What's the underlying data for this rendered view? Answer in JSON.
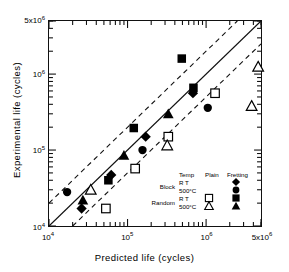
{
  "chart_data": {
    "type": "scatter",
    "title": "",
    "xlabel": "Predicted life  (cycles)",
    "ylabel": "Experimental  life  (cycles)",
    "xlim": [
      10000,
      5000000
    ],
    "ylim": [
      10000,
      5000000
    ],
    "xscale": "log",
    "yscale": "log",
    "grid": false,
    "legend_position": "inside-lower-right",
    "xticks": [
      {
        "value": 10000,
        "label": "10",
        "exp": "4"
      },
      {
        "value": 100000,
        "label": "10",
        "exp": "5"
      },
      {
        "value": 1000000,
        "label": "10",
        "exp": "6"
      },
      {
        "value": 5000000,
        "label": "5x10",
        "exp": "6"
      }
    ],
    "yticks": [
      {
        "value": 10000,
        "label": "10",
        "exp": "4"
      },
      {
        "value": 100000,
        "label": "10",
        "exp": "5"
      },
      {
        "value": 1000000,
        "label": "10",
        "exp": "6"
      },
      {
        "value": 5000000,
        "label": "5x10",
        "exp": "6"
      }
    ],
    "reference_lines": [
      {
        "name": "one-to-one",
        "style": "solid",
        "factor": 1
      },
      {
        "name": "upper-bound-factor-2",
        "style": "dashed",
        "factor": 2
      },
      {
        "name": "lower-bound-factor-2",
        "style": "dashed",
        "factor": 0.5
      }
    ],
    "series": [
      {
        "name": "Block R T Fretting",
        "marker": "filled-diamond",
        "condition": "Fretting",
        "loading": "Block",
        "temperature": "R T",
        "points": [
          {
            "x": 26000,
            "y": 17000
          },
          {
            "x": 62000,
            "y": 47000
          },
          {
            "x": 170000,
            "y": 150000
          },
          {
            "x": 680000,
            "y": 560000
          }
        ]
      },
      {
        "name": "Block 500°C Fretting",
        "marker": "filled-circle",
        "condition": "Fretting",
        "loading": "Block",
        "temperature": "500°C",
        "points": [
          {
            "x": 17000,
            "y": 28000
          },
          {
            "x": 155000,
            "y": 100000
          },
          {
            "x": 1050000,
            "y": 360000
          }
        ]
      },
      {
        "name": "Random R T Fretting",
        "marker": "filled-square",
        "condition": "Fretting",
        "loading": "Random",
        "temperature": "R T",
        "points": [
          {
            "x": 57000,
            "y": 40000
          },
          {
            "x": 120000,
            "y": 195000
          },
          {
            "x": 490000,
            "y": 1600000
          },
          {
            "x": 690000,
            "y": 660000
          }
        ]
      },
      {
        "name": "Random 500°C Fretting",
        "marker": "filled-triangle",
        "condition": "Fretting",
        "loading": "Random",
        "temperature": "500°C",
        "points": [
          {
            "x": 27000,
            "y": 22000
          },
          {
            "x": 90000,
            "y": 85000
          },
          {
            "x": 330000,
            "y": 300000
          }
        ]
      },
      {
        "name": "Random R T Plain",
        "marker": "open-square",
        "condition": "Plain",
        "loading": "Random",
        "temperature": "R T",
        "points": [
          {
            "x": 53000,
            "y": 17000
          },
          {
            "x": 125000,
            "y": 57000
          },
          {
            "x": 330000,
            "y": 150000
          },
          {
            "x": 1300000,
            "y": 560000
          }
        ]
      },
      {
        "name": "Random 500°C Plain",
        "marker": "open-triangle",
        "condition": "Plain",
        "loading": "Random",
        "temperature": "500°C",
        "points": [
          {
            "x": 34000,
            "y": 30000
          },
          {
            "x": 320000,
            "y": 115000
          },
          {
            "x": 3800000,
            "y": 380000
          },
          {
            "x": 4600000,
            "y": 1250000
          }
        ]
      }
    ]
  },
  "legend": {
    "headers": {
      "temp": "Temp",
      "plain": "Plain",
      "fretting": "Fretting"
    },
    "row_groups": [
      {
        "label": "Block"
      },
      {
        "label": "Random"
      }
    ],
    "rows": [
      {
        "temp": "R T",
        "plain_marker": "",
        "fretting_marker": "filled-diamond"
      },
      {
        "temp": "500°C",
        "plain_marker": "",
        "fretting_marker": "filled-circle"
      },
      {
        "temp": "R T",
        "plain_marker": "open-square",
        "fretting_marker": "filled-square"
      },
      {
        "temp": "500°C",
        "plain_marker": "open-triangle",
        "fretting_marker": "filled-triangle"
      }
    ]
  },
  "colors": {
    "ink": "#111111",
    "marker_fill": "#000000",
    "background": "#ffffff"
  }
}
